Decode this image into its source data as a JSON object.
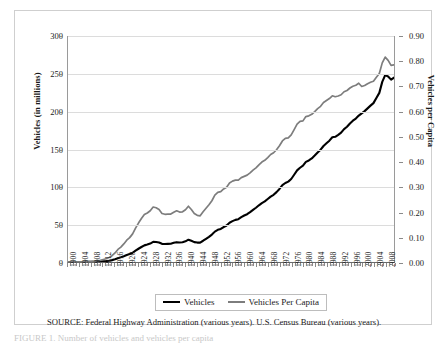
{
  "figure": {
    "source_note": "SOURCE:   Federal Highway Administration  (various years).  U.S. Census Bureau (various years).",
    "caption": "FIGURE 1.  Number of vehicles and vehicles per capita"
  },
  "chart_data": {
    "type": "line",
    "title": "",
    "xlabel": "",
    "ylabel": "Vehicles (in millions)",
    "y2label": "Vehicles per Capita",
    "grid": true,
    "legend_position": "bottom",
    "xlim": [
      1900,
      2011
    ],
    "ylim": [
      0,
      300
    ],
    "y2lim": [
      0.0,
      0.9
    ],
    "yticks": [
      "0",
      "50",
      "100",
      "150",
      "200",
      "250",
      "300"
    ],
    "ytick_values": [
      0,
      50,
      100,
      150,
      200,
      250,
      300
    ],
    "y2ticks": [
      "0.00",
      "0.10",
      "0.20",
      "0.30",
      "0.40",
      "0.50",
      "0.60",
      "0.70",
      "0.80",
      "0.90"
    ],
    "y2tick_values": [
      0.0,
      0.1,
      0.2,
      0.3,
      0.4,
      0.5,
      0.6,
      0.7,
      0.8,
      0.9
    ],
    "xtick_labels": [
      "1900",
      "1904",
      "1908",
      "1912",
      "1916",
      "1920",
      "1924",
      "1928",
      "1932",
      "1936",
      "1940",
      "1944",
      "1948",
      "1952",
      "1956",
      "1960",
      "1964",
      "1968",
      "1972",
      "1976",
      "1980",
      "1984",
      "1988",
      "1992",
      "1996",
      "2000",
      "2004",
      "2008"
    ],
    "xtick_step": 4,
    "x": [
      1900,
      1901,
      1902,
      1903,
      1904,
      1905,
      1906,
      1907,
      1908,
      1909,
      1910,
      1911,
      1912,
      1913,
      1914,
      1915,
      1916,
      1917,
      1918,
      1919,
      1920,
      1921,
      1922,
      1923,
      1924,
      1925,
      1926,
      1927,
      1928,
      1929,
      1930,
      1931,
      1932,
      1933,
      1934,
      1935,
      1936,
      1937,
      1938,
      1939,
      1940,
      1941,
      1942,
      1943,
      1944,
      1945,
      1946,
      1947,
      1948,
      1949,
      1950,
      1951,
      1952,
      1953,
      1954,
      1955,
      1956,
      1957,
      1958,
      1959,
      1960,
      1961,
      1962,
      1963,
      1964,
      1965,
      1966,
      1967,
      1968,
      1969,
      1970,
      1971,
      1972,
      1973,
      1974,
      1975,
      1976,
      1977,
      1978,
      1979,
      1980,
      1981,
      1982,
      1983,
      1984,
      1985,
      1986,
      1987,
      1988,
      1989,
      1990,
      1991,
      1992,
      1993,
      1994,
      1995,
      1996,
      1997,
      1998,
      1999,
      2000,
      2001,
      2002,
      2003,
      2004,
      2005,
      2006,
      2007,
      2008,
      2009,
      2010,
      2011
    ],
    "series": [
      {
        "name": "Vehicles",
        "axis": "left",
        "units": "millions",
        "color": "#000000",
        "values": [
          0.008,
          0.015,
          0.023,
          0.033,
          0.055,
          0.078,
          0.106,
          0.143,
          0.194,
          0.312,
          0.468,
          0.639,
          0.944,
          1.26,
          1.76,
          2.49,
          3.62,
          5.12,
          6.16,
          7.56,
          9.24,
          10.49,
          12.27,
          15.09,
          17.59,
          19.94,
          22.06,
          23.13,
          24.49,
          26.7,
          26.53,
          25.81,
          24.12,
          23.86,
          24.11,
          24.29,
          25.43,
          26.33,
          25.84,
          26.19,
          27.46,
          29.62,
          28.14,
          26.36,
          25.78,
          25.79,
          28.22,
          30.84,
          33.36,
          36.4,
          40.33,
          42.69,
          43.82,
          46.43,
          48.47,
          52.14,
          54.21,
          55.91,
          56.85,
          59.46,
          61.68,
          63.43,
          66.11,
          69.1,
          72.0,
          75.26,
          78.15,
          80.41,
          83.56,
          86.81,
          89.24,
          92.75,
          96.98,
          101.99,
          104.86,
          106.71,
          110.19,
          115.8,
          121.6,
          125.12,
          127.91,
          132.95,
          134.81,
          137.43,
          141.26,
          145.43,
          149.13,
          153.99,
          157.54,
          161.03,
          165.56,
          166.15,
          168.74,
          171.64,
          176.41,
          179.52,
          183.94,
          187.58,
          190.42,
          194.34,
          197.39,
          200.27,
          203.92,
          207.55,
          210.91,
          217.83,
          224.48,
          239.13,
          248.04,
          246.28,
          242.06,
          244.71
        ]
      },
      {
        "name": "Vehicles Per Capita",
        "axis": "right",
        "units": "vehicles per person",
        "color": "#7d7d7d",
        "values": [
          0.0001,
          0.0002,
          0.0003,
          0.0004,
          0.0007,
          0.0009,
          0.0012,
          0.0017,
          0.0022,
          0.0035,
          0.0051,
          0.0068,
          0.0099,
          0.013,
          0.018,
          0.025,
          0.036,
          0.05,
          0.059,
          0.072,
          0.087,
          0.097,
          0.112,
          0.135,
          0.155,
          0.173,
          0.189,
          0.195,
          0.204,
          0.219,
          0.216,
          0.209,
          0.193,
          0.19,
          0.191,
          0.191,
          0.198,
          0.204,
          0.199,
          0.2,
          0.208,
          0.222,
          0.209,
          0.193,
          0.186,
          0.184,
          0.2,
          0.214,
          0.228,
          0.244,
          0.266,
          0.277,
          0.28,
          0.291,
          0.298,
          0.315,
          0.322,
          0.326,
          0.326,
          0.336,
          0.341,
          0.346,
          0.355,
          0.366,
          0.375,
          0.387,
          0.398,
          0.405,
          0.416,
          0.428,
          0.435,
          0.447,
          0.463,
          0.482,
          0.492,
          0.494,
          0.506,
          0.527,
          0.549,
          0.56,
          0.562,
          0.579,
          0.582,
          0.588,
          0.599,
          0.611,
          0.62,
          0.635,
          0.643,
          0.651,
          0.662,
          0.658,
          0.661,
          0.666,
          0.678,
          0.683,
          0.693,
          0.7,
          0.704,
          0.712,
          0.699,
          0.703,
          0.71,
          0.716,
          0.72,
          0.736,
          0.751,
          0.793,
          0.816,
          0.803,
          0.783,
          0.785
        ]
      }
    ],
    "legend": [
      {
        "label": "Vehicles",
        "color": "#000000"
      },
      {
        "label": "Vehicles Per Capita",
        "color": "#7d7d7d"
      }
    ],
    "annotations": []
  }
}
